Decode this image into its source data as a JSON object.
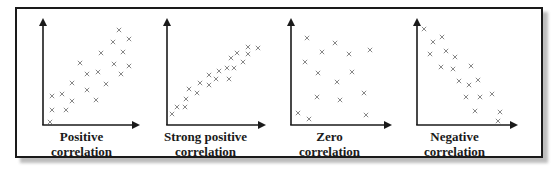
{
  "colors": {
    "frame": "#1a1a1a",
    "axis": "#1a1a1a",
    "marker": "#7a7a7a",
    "shadow": "#bdbdbd"
  },
  "chart_data": [
    {
      "type": "scatter",
      "title": "Positive correlation",
      "title_lines": [
        "Positive",
        "correlation"
      ],
      "xlabel": "",
      "ylabel": "",
      "marker": "x",
      "grid": false,
      "ticks": false,
      "points": [
        [
          119,
          30
        ],
        [
          113,
          42
        ],
        [
          129,
          39
        ],
        [
          101,
          53
        ],
        [
          123,
          52
        ],
        [
          80,
          63
        ],
        [
          114,
          64
        ],
        [
          129,
          66
        ],
        [
          87,
          74
        ],
        [
          98,
          72
        ],
        [
          121,
          74
        ],
        [
          72,
          83
        ],
        [
          106,
          84
        ],
        [
          87,
          90
        ],
        [
          52,
          96
        ],
        [
          62,
          94
        ],
        [
          72,
          101
        ],
        [
          96,
          100
        ],
        [
          52,
          110
        ],
        [
          66,
          110
        ],
        [
          50,
          122
        ]
      ]
    },
    {
      "type": "scatter",
      "title": "Strong positive correlation",
      "title_lines": [
        "Strong positive",
        "correlation"
      ],
      "xlabel": "",
      "ylabel": "",
      "marker": "x",
      "grid": false,
      "ticks": false,
      "points": [
        [
          248,
          47
        ],
        [
          258,
          48
        ],
        [
          237,
          53
        ],
        [
          231,
          58
        ],
        [
          248,
          54
        ],
        [
          243,
          62
        ],
        [
          227,
          68
        ],
        [
          234,
          68
        ],
        [
          219,
          71
        ],
        [
          209,
          75
        ],
        [
          216,
          79
        ],
        [
          229,
          79
        ],
        [
          200,
          83
        ],
        [
          209,
          85
        ],
        [
          189,
          89
        ],
        [
          197,
          93
        ],
        [
          186,
          99
        ],
        [
          177,
          107
        ],
        [
          185,
          107
        ],
        [
          172,
          114
        ]
      ]
    },
    {
      "type": "scatter",
      "title": "Zero correlation",
      "title_lines": [
        "Zero",
        "correlation"
      ],
      "xlabel": "",
      "ylabel": "",
      "marker": "x",
      "grid": false,
      "ticks": false,
      "points": [
        [
          307,
          38
        ],
        [
          335,
          43
        ],
        [
          322,
          52
        ],
        [
          349,
          54
        ],
        [
          370,
          50
        ],
        [
          305,
          62
        ],
        [
          318,
          73
        ],
        [
          352,
          72
        ],
        [
          337,
          82
        ],
        [
          317,
          97
        ],
        [
          340,
          100
        ],
        [
          364,
          93
        ],
        [
          298,
          113
        ],
        [
          309,
          119
        ],
        [
          366,
          115
        ]
      ]
    },
    {
      "type": "scatter",
      "title": "Negative correlation",
      "title_lines": [
        "Negative",
        "correlation"
      ],
      "xlabel": "",
      "ylabel": "",
      "marker": "x",
      "grid": false,
      "ticks": false,
      "points": [
        [
          424,
          29
        ],
        [
          433,
          42
        ],
        [
          442,
          37
        ],
        [
          430,
          54
        ],
        [
          446,
          51
        ],
        [
          455,
          57
        ],
        [
          441,
          67
        ],
        [
          453,
          69
        ],
        [
          471,
          66
        ],
        [
          459,
          81
        ],
        [
          469,
          85
        ],
        [
          478,
          80
        ],
        [
          466,
          97
        ],
        [
          480,
          97
        ],
        [
          492,
          94
        ],
        [
          475,
          111
        ],
        [
          500,
          112
        ],
        [
          498,
          121
        ]
      ]
    }
  ],
  "panels": [
    {
      "axis": {
        "x0": 43,
        "y0": 125,
        "ytop": 18,
        "xend": 140
      },
      "label_left": 27
    },
    {
      "axis": {
        "x0": 167,
        "y0": 125,
        "ytop": 18,
        "xend": 266
      },
      "label_left": 150
    },
    {
      "axis": {
        "x0": 291,
        "y0": 125,
        "ytop": 18,
        "xend": 392
      },
      "label_left": 273
    },
    {
      "axis": {
        "x0": 417,
        "y0": 125,
        "ytop": 18,
        "xend": 518
      },
      "label_left": 398
    }
  ]
}
